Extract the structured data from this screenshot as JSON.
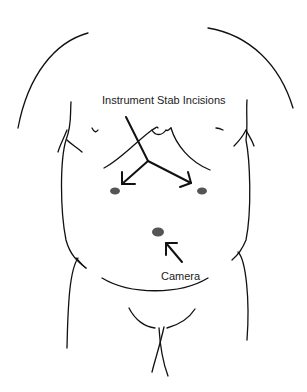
{
  "diagram": {
    "type": "anatomical-schematic",
    "labels": {
      "instruments": "Instrument Stab Incisions",
      "camera": "Camera"
    },
    "ports": [
      {
        "id": "left-instrument-port",
        "x": 115,
        "y": 191
      },
      {
        "id": "right-instrument-port",
        "x": 202,
        "y": 191
      },
      {
        "id": "camera-port",
        "x": 158,
        "y": 232
      }
    ],
    "colors": {
      "stroke": "#111111",
      "port": "#555555",
      "text": "#222222",
      "background": "#ffffff"
    }
  }
}
